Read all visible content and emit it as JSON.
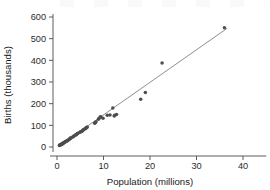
{
  "chart_data": {
    "type": "scatter",
    "title": "",
    "xlabel": "Population (millions)",
    "ylabel": "Births (thousands)",
    "xlim": [
      -1.5,
      45
    ],
    "ylim": [
      -40,
      640
    ],
    "xticks": [
      0,
      10,
      20,
      30,
      40
    ],
    "yticks": [
      0,
      100,
      200,
      300,
      400,
      500,
      600
    ],
    "grid": false,
    "legend": null,
    "marker_color": "#4d4d4d",
    "line_color": "#7a7a7a",
    "axis_color": "#4a4a4a",
    "series": [
      {
        "name": "States",
        "x": [
          0.5,
          0.6,
          0.6,
          0.7,
          0.8,
          0.9,
          0.9,
          1.0,
          1.1,
          1.2,
          1.3,
          1.3,
          1.4,
          1.6,
          1.7,
          1.8,
          1.8,
          2.0,
          2.1,
          2.3,
          2.4,
          2.6,
          2.7,
          2.8,
          2.9,
          3.0,
          3.4,
          3.5,
          3.7,
          4.0,
          4.1,
          4.3,
          4.4,
          4.5,
          4.9,
          5.1,
          5.3,
          5.4,
          5.6,
          5.7,
          6.0,
          6.1,
          6.3,
          6.4,
          6.5,
          8.1,
          8.2,
          8.4,
          8.9,
          9.0,
          9.3,
          9.4,
          9.9,
          10.8,
          11.4,
          12.0,
          12.3,
          12.4,
          12.8,
          18.0,
          19.0,
          22.6,
          36.0
        ],
        "y": [
          7,
          8,
          9,
          10,
          11,
          12,
          13,
          12,
          14,
          15,
          17,
          18,
          19,
          21,
          23,
          24,
          25,
          27,
          28,
          30,
          32,
          35,
          37,
          39,
          41,
          42,
          46,
          48,
          52,
          55,
          57,
          60,
          62,
          64,
          68,
          70,
          72,
          74,
          78,
          80,
          83,
          86,
          88,
          90,
          92,
          110,
          112,
          116,
          128,
          132,
          138,
          140,
          133,
          146,
          148,
          180,
          143,
          147,
          150,
          220,
          252,
          388,
          550
        ]
      }
    ],
    "fit_line": {
      "name": "least-squares fit",
      "x_start": 0.4,
      "y_start": 4,
      "x_end": 36.6,
      "y_end": 548
    }
  },
  "accessibility": {
    "chart_description": "Scatter plot of births in thousands versus population in millions, with a fitted straight line rising from the origin through the cluster of points."
  }
}
